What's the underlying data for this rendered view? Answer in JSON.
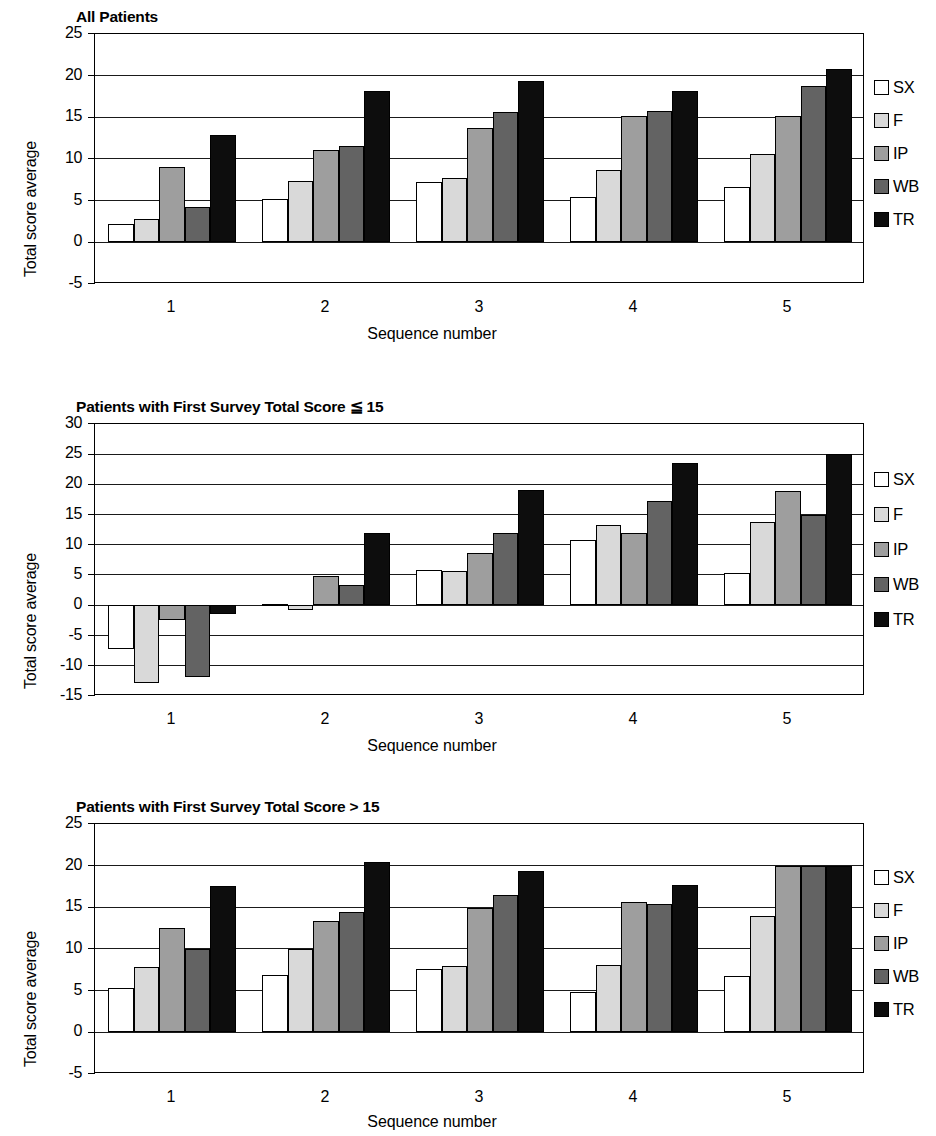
{
  "series_colors": {
    "SX": "#ffffff",
    "F": "#d9d9d9",
    "IP": "#9e9e9e",
    "WB": "#636363",
    "TR": "#0d0d0d"
  },
  "common": {
    "ylabel": "Total score average",
    "xlabel": "Sequence number",
    "categories": [
      "1",
      "2",
      "3",
      "4",
      "5"
    ],
    "legend": [
      "SX",
      "F",
      "IP",
      "WB",
      "TR"
    ]
  },
  "charts": [
    {
      "id": "all-patients",
      "title": "All Patients",
      "ylabel": "Total score average",
      "xlabel": "Sequence number",
      "yticks": [
        "25",
        "20",
        "15",
        "10",
        "5",
        "0",
        "-5"
      ],
      "ylim": [
        -5,
        25
      ],
      "ystep": 5
    },
    {
      "id": "score-le-15",
      "title": "Patients with First Survey Total Score ≦ 15",
      "ylabel": "Total score average",
      "xlabel": "Sequence number",
      "yticks": [
        "30",
        "25",
        "20",
        "15",
        "10",
        "5",
        "0",
        "-5",
        "-10",
        "-15"
      ],
      "ylim": [
        -15,
        30
      ],
      "ystep": 5
    },
    {
      "id": "score-gt-15",
      "title": "Patients with First Survey Total Score > 15",
      "ylabel": "Total score average",
      "xlabel": "Sequence number",
      "yticks": [
        "25",
        "20",
        "15",
        "10",
        "5",
        "0",
        "-5"
      ],
      "ylim": [
        -5,
        25
      ],
      "ystep": 5
    }
  ],
  "chart_data": [
    {
      "type": "bar",
      "title": "All Patients",
      "xlabel": "Sequence number",
      "ylabel": "Total score average",
      "categories": [
        "1",
        "2",
        "3",
        "4",
        "5"
      ],
      "ylim": [
        -5,
        25
      ],
      "yticks": [
        -5,
        0,
        5,
        10,
        15,
        20,
        25
      ],
      "grid": true,
      "legend_position": "right",
      "series": [
        {
          "name": "SX",
          "values": [
            2.2,
            5.2,
            7.2,
            5.4,
            6.6
          ]
        },
        {
          "name": "F",
          "values": [
            2.8,
            7.4,
            7.7,
            8.7,
            10.6
          ]
        },
        {
          "name": "IP",
          "values": [
            9.1,
            11.1,
            13.7,
            15.2,
            15.2
          ]
        },
        {
          "name": "WB",
          "values": [
            4.3,
            11.6,
            15.6,
            15.8,
            18.8
          ]
        },
        {
          "name": "TR",
          "values": [
            12.9,
            18.2,
            19.4,
            18.2,
            20.8
          ]
        }
      ]
    },
    {
      "type": "bar",
      "title": "Patients with First Survey Total Score ≦ 15",
      "xlabel": "Sequence number",
      "ylabel": "Total score average",
      "categories": [
        "1",
        "2",
        "3",
        "4",
        "5"
      ],
      "ylim": [
        -15,
        30
      ],
      "yticks": [
        -15,
        -10,
        -5,
        0,
        5,
        10,
        15,
        20,
        25,
        30
      ],
      "grid": true,
      "legend_position": "right",
      "series": [
        {
          "name": "SX",
          "values": [
            -7.3,
            0.3,
            5.8,
            10.8,
            5.4
          ]
        },
        {
          "name": "F",
          "values": [
            -12.9,
            -0.8,
            5.7,
            13.3,
            13.8
          ]
        },
        {
          "name": "IP",
          "values": [
            -2.4,
            4.9,
            8.7,
            12.0,
            18.9
          ]
        },
        {
          "name": "WB",
          "values": [
            -11.9,
            3.3,
            11.9,
            17.3,
            14.9
          ]
        },
        {
          "name": "TR",
          "values": [
            -1.4,
            11.9,
            19.0,
            23.5,
            25.1
          ]
        }
      ]
    },
    {
      "type": "bar",
      "title": "Patients with First Survey Total Score > 15",
      "xlabel": "Sequence number",
      "ylabel": "Total score average",
      "categories": [
        "1",
        "2",
        "3",
        "4",
        "5"
      ],
      "ylim": [
        -5,
        25
      ],
      "yticks": [
        -5,
        0,
        5,
        10,
        15,
        20,
        25
      ],
      "grid": true,
      "legend_position": "right",
      "series": [
        {
          "name": "SX",
          "values": [
            5.3,
            6.9,
            7.6,
            4.9,
            6.8
          ]
        },
        {
          "name": "F",
          "values": [
            7.9,
            10.0,
            8.0,
            8.1,
            14.0
          ]
        },
        {
          "name": "IP",
          "values": [
            12.5,
            13.4,
            14.9,
            15.7,
            20.0
          ]
        },
        {
          "name": "WB",
          "values": [
            10.0,
            14.5,
            16.5,
            15.4,
            20.0
          ]
        },
        {
          "name": "TR",
          "values": [
            17.6,
            20.5,
            19.4,
            17.7,
            20.0
          ]
        }
      ]
    }
  ]
}
